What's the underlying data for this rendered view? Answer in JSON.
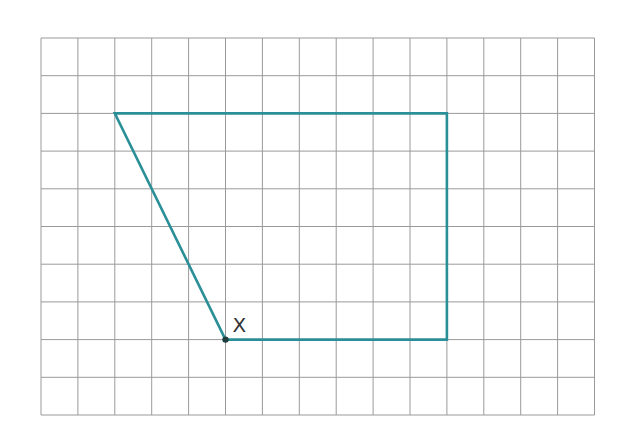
{
  "grid": {
    "columns": 15,
    "rows": 10,
    "origin_x": 41,
    "origin_y": 38,
    "cell_width": 36.9,
    "cell_height": 37.7,
    "line_color": "#9a9a9a"
  },
  "shape": {
    "color": "#2a8f96",
    "vertices": [
      [
        2,
        2
      ],
      [
        11,
        2
      ],
      [
        11,
        8
      ],
      [
        5,
        8
      ]
    ],
    "closed": true
  },
  "point": {
    "label": "X",
    "grid_x": 5,
    "grid_y": 8,
    "color": "#1f3f3f"
  }
}
